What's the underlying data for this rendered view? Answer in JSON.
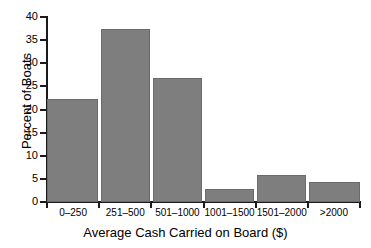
{
  "chart_data": {
    "type": "bar",
    "title": "",
    "xlabel": "Average Cash Carried on Board ($)",
    "ylabel": "Percent of Boats",
    "categories": [
      "0–250",
      "251–500",
      "501–1000",
      "1001–1500",
      "1501–2000",
      ">2000"
    ],
    "values": [
      22.3,
      37.4,
      26.8,
      2.8,
      5.8,
      4.3
    ],
    "ylim": [
      0,
      40
    ],
    "yticks": [
      0,
      5,
      10,
      15,
      20,
      25,
      30,
      35,
      40
    ],
    "ytick_labels": [
      "0",
      "5",
      "10",
      "15",
      "20",
      "25",
      "30",
      "35",
      "40"
    ],
    "grid": false,
    "legend": false,
    "bar_color": "#7e7e7e",
    "axis_color": "#1a1a1a",
    "background": "#ffffff"
  }
}
